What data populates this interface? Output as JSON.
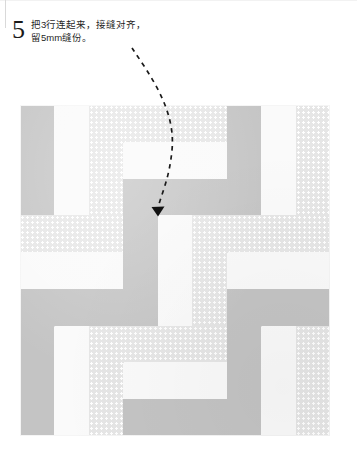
{
  "step": {
    "number": "5",
    "lines": [
      "把3行连起来，接缝对齐，",
      "留5mm缝份。"
    ]
  },
  "annotation": {
    "arrow_name": "curved-dashed-arrow",
    "arrow_description": "虚线箭头指向接缝交点"
  },
  "colors": {
    "fabric_gray": "#c4c4c4",
    "fabric_white": "#fafafa",
    "fabric_dot_base": "#e6e6e6",
    "fabric_dot_spot": "#ffffff",
    "arrow": "#1a1a1a",
    "page_background": "#ffffff",
    "text": "#1f1f1f"
  },
  "quilt": {
    "label": "拼布方块示意图",
    "rows": 3,
    "cols": 3,
    "strips_per_block": 3,
    "fabrics": [
      "gray",
      "white",
      "dot"
    ],
    "blocks": [
      {
        "row": 0,
        "col": 0,
        "orientation": "vertical",
        "strips": [
          "gray",
          "white",
          "dot"
        ]
      },
      {
        "row": 0,
        "col": 1,
        "orientation": "horizontal",
        "strips": [
          "dot",
          "white",
          "gray"
        ]
      },
      {
        "row": 0,
        "col": 2,
        "orientation": "vertical",
        "strips": [
          "gray",
          "white",
          "dot"
        ]
      },
      {
        "row": 1,
        "col": 0,
        "orientation": "horizontal",
        "strips": [
          "dot",
          "white",
          "gray"
        ]
      },
      {
        "row": 1,
        "col": 1,
        "orientation": "vertical",
        "strips": [
          "gray",
          "white",
          "dot"
        ]
      },
      {
        "row": 1,
        "col": 2,
        "orientation": "horizontal",
        "strips": [
          "dot",
          "white",
          "gray"
        ]
      },
      {
        "row": 2,
        "col": 0,
        "orientation": "vertical",
        "strips": [
          "gray",
          "white",
          "dot"
        ]
      },
      {
        "row": 2,
        "col": 1,
        "orientation": "horizontal",
        "strips": [
          "dot",
          "white",
          "gray"
        ]
      },
      {
        "row": 2,
        "col": 2,
        "orientation": "vertical",
        "strips": [
          "gray",
          "white",
          "dot"
        ]
      }
    ]
  }
}
